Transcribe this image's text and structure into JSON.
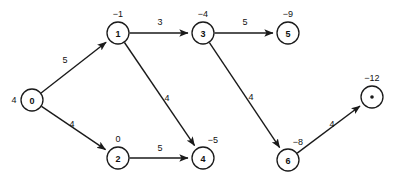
{
  "figure": {
    "title": "",
    "background_color": "#ffffff",
    "stroke_color": "#1a1a1a",
    "width": 396,
    "height": 185
  },
  "chart_data": {
    "type": "diagram",
    "diagram_kind": "directed-weighted-graph",
    "title": "",
    "xlabel": "",
    "ylabel": "",
    "grid": false,
    "legend": "none",
    "nodes": [
      {
        "id": "0",
        "text": "0",
        "label": "4",
        "label_position": "left",
        "cx": 32,
        "cy": 100,
        "r": 11,
        "shape": "circle"
      },
      {
        "id": "1",
        "text": "1",
        "label": "−1",
        "label_position": "top",
        "cx": 118,
        "cy": 33,
        "r": 11,
        "shape": "circle"
      },
      {
        "id": "2",
        "text": "2",
        "label": "0",
        "label_position": "top",
        "cx": 118,
        "cy": 158,
        "r": 11,
        "shape": "circle"
      },
      {
        "id": "3",
        "text": "3",
        "label": "−4",
        "label_position": "top",
        "cx": 203,
        "cy": 33,
        "r": 11,
        "shape": "circle"
      },
      {
        "id": "4",
        "text": "4",
        "label": "−5",
        "label_position": "top-right",
        "cx": 203,
        "cy": 158,
        "r": 11,
        "shape": "circle"
      },
      {
        "id": "5",
        "text": "5",
        "label": "−9",
        "label_position": "top",
        "cx": 288,
        "cy": 33,
        "r": 11,
        "shape": "circle"
      },
      {
        "id": "6",
        "text": "6",
        "label": "−8",
        "label_position": "top-right",
        "cx": 288,
        "cy": 160,
        "r": 11,
        "shape": "circle"
      },
      {
        "id": "7",
        "text": "•",
        "label": "−12",
        "label_position": "top",
        "cx": 372,
        "cy": 97,
        "r": 11,
        "shape": "circle-dot"
      }
    ],
    "edges": [
      {
        "from": "0",
        "to": "1",
        "weight": "5",
        "label_x": 65,
        "label_y": 60
      },
      {
        "from": "0",
        "to": "2",
        "weight": "4",
        "label_x": 72,
        "label_y": 124
      },
      {
        "from": "1",
        "to": "3",
        "weight": "3",
        "label_x": 160,
        "label_y": 22
      },
      {
        "from": "1",
        "to": "4",
        "weight": "4",
        "label_x": 167,
        "label_y": 98
      },
      {
        "from": "3",
        "to": "5",
        "weight": "5",
        "label_x": 245,
        "label_y": 22
      },
      {
        "from": "3",
        "to": "6",
        "weight": "4",
        "label_x": 251,
        "label_y": 97
      },
      {
        "from": "2",
        "to": "4",
        "weight": "5",
        "label_x": 160,
        "label_y": 148
      },
      {
        "from": "6",
        "to": "7",
        "weight": "4",
        "label_x": 332,
        "label_y": 124
      }
    ],
    "node_labels_meaning": "distance / potential value shown beside each vertex",
    "edge_labels_meaning": "edge weight"
  }
}
